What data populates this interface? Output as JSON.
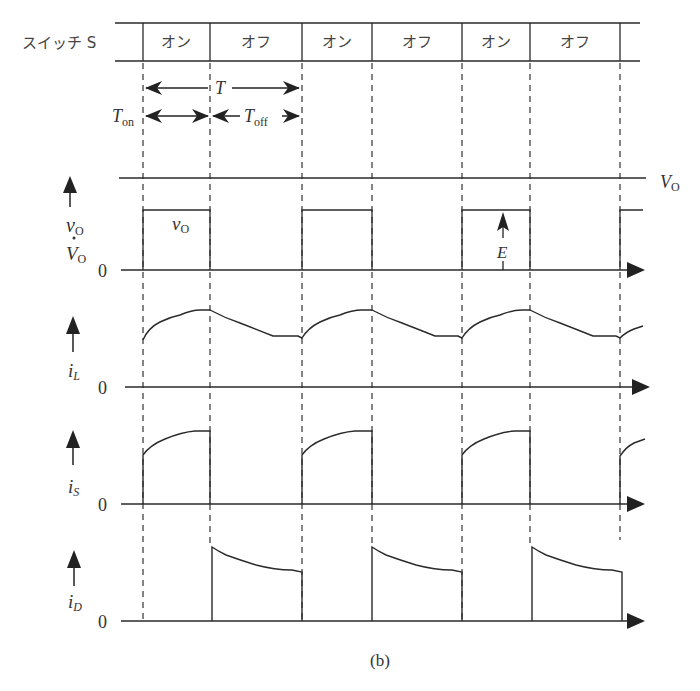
{
  "figure": {
    "caption": "(b)",
    "switch_row": {
      "label": "スイッチ S",
      "cells": [
        {
          "label": "オン"
        },
        {
          "label": "オフ"
        },
        {
          "label": "オン"
        },
        {
          "label": "オフ"
        },
        {
          "label": "オン"
        },
        {
          "label": "オフ"
        }
      ]
    },
    "period_labels": {
      "T": "T",
      "T_on": "T",
      "T_on_sub": "on",
      "T_off": "T",
      "T_off_sub": "off"
    },
    "panels": [
      {
        "name": "vo",
        "axis_label_top": "v",
        "axis_label_top_sub": "O",
        "axis_label_dot": "·",
        "axis_label_bottom": "V",
        "axis_label_bottom_sub": "O",
        "zero": "0",
        "inside_label": "v",
        "inside_label_sub": "O",
        "reference_label": "V",
        "reference_label_sub": "O",
        "E_label": "E"
      },
      {
        "name": "iL",
        "axis_label": "i",
        "axis_label_sub": "L",
        "zero": "0"
      },
      {
        "name": "iS",
        "axis_label": "i",
        "axis_label_sub": "S",
        "zero": "0"
      },
      {
        "name": "iD",
        "axis_label": "i",
        "axis_label_sub": "D",
        "zero": "0"
      }
    ]
  },
  "colors": {
    "line": "#2a2a2a",
    "background": "#ffffff"
  }
}
